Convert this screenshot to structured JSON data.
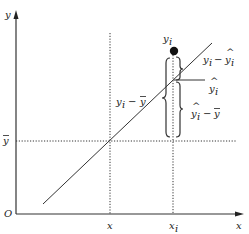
{
  "diagram": {
    "title": "",
    "axes": {
      "origin_label": "O",
      "x_axis_label": "x",
      "y_axis_label": "y"
    },
    "reference_lines": {
      "mean_x_label": "x̄",
      "x_i_label": "x",
      "x_i_sub": "i",
      "mean_y_label": "ȳ"
    },
    "point": {
      "label": "y",
      "label_sub": "i"
    },
    "decomposition": {
      "total_deviation": {
        "y": "y",
        "sub": "i",
        "op": " − ",
        "mean": "ȳ"
      },
      "residual": {
        "y": "y",
        "sub": "i",
        "op": " − ",
        "hat": "ŷ",
        "hat_sub": "i"
      },
      "fitted": {
        "hat": "ŷ",
        "sub": "i"
      },
      "explained": {
        "hat": "ŷ",
        "sub": "i",
        "op": " − ",
        "mean": "ȳ"
      }
    },
    "colors": {
      "line": "#333333",
      "point": "#111111",
      "background": "#ffffff"
    }
  }
}
